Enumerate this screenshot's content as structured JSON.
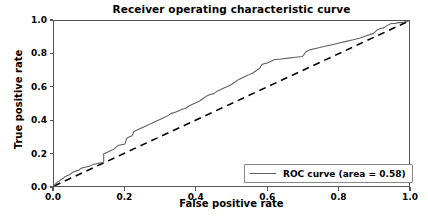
{
  "chart_data": {
    "type": "line",
    "title": "Receiver operating characteristic curve",
    "xlabel": "False positive rate",
    "ylabel": "True positive rate",
    "xlim": [
      0.0,
      1.0
    ],
    "ylim": [
      0.0,
      1.0
    ],
    "xticks": [
      "0.0",
      "0.2",
      "0.4",
      "0.6",
      "0.8",
      "1.0"
    ],
    "xtick_values": [
      0.0,
      0.2,
      0.4,
      0.6,
      0.8,
      1.0
    ],
    "yticks": [
      "0.0",
      "0.2",
      "0.4",
      "0.6",
      "0.8",
      "1.0"
    ],
    "ytick_values": [
      0.0,
      0.2,
      0.4,
      0.6,
      0.8,
      1.0
    ],
    "grid": false,
    "legend_position": "lower right",
    "series": [
      {
        "name": "ROC curve (area = 0.58)",
        "auc": 0.58,
        "color": "#606060",
        "linestyle": "solid",
        "x": [
          0.0,
          0.005,
          0.01,
          0.015,
          0.02,
          0.025,
          0.03,
          0.035,
          0.04,
          0.045,
          0.05,
          0.06,
          0.07,
          0.075,
          0.08,
          0.09,
          0.1,
          0.105,
          0.11,
          0.12,
          0.13,
          0.135,
          0.14,
          0.14,
          0.145,
          0.15,
          0.16,
          0.17,
          0.175,
          0.18,
          0.19,
          0.2,
          0.205,
          0.21,
          0.22,
          0.225,
          0.23,
          0.24,
          0.25,
          0.26,
          0.27,
          0.28,
          0.29,
          0.3,
          0.31,
          0.32,
          0.33,
          0.34,
          0.35,
          0.36,
          0.37,
          0.38,
          0.39,
          0.4,
          0.41,
          0.42,
          0.43,
          0.44,
          0.45,
          0.46,
          0.47,
          0.48,
          0.49,
          0.5,
          0.51,
          0.52,
          0.53,
          0.54,
          0.55,
          0.56,
          0.57,
          0.58,
          0.585,
          0.59,
          0.6,
          0.61,
          0.62,
          0.64,
          0.66,
          0.68,
          0.7,
          0.705,
          0.71,
          0.715,
          0.72,
          0.74,
          0.76,
          0.78,
          0.8,
          0.82,
          0.84,
          0.86,
          0.88,
          0.9,
          0.91,
          0.92,
          0.93,
          0.94,
          0.95,
          0.96,
          0.97,
          0.98,
          0.99,
          1.0
        ],
        "y": [
          0.0,
          0.015,
          0.025,
          0.03,
          0.04,
          0.045,
          0.055,
          0.06,
          0.065,
          0.07,
          0.08,
          0.09,
          0.095,
          0.105,
          0.11,
          0.115,
          0.12,
          0.125,
          0.13,
          0.135,
          0.14,
          0.14,
          0.145,
          0.195,
          0.2,
          0.205,
          0.215,
          0.225,
          0.235,
          0.245,
          0.25,
          0.255,
          0.29,
          0.295,
          0.305,
          0.33,
          0.335,
          0.345,
          0.355,
          0.365,
          0.375,
          0.385,
          0.395,
          0.405,
          0.415,
          0.425,
          0.44,
          0.445,
          0.455,
          0.465,
          0.47,
          0.485,
          0.495,
          0.505,
          0.515,
          0.53,
          0.545,
          0.555,
          0.56,
          0.575,
          0.585,
          0.595,
          0.605,
          0.615,
          0.63,
          0.645,
          0.655,
          0.665,
          0.675,
          0.685,
          0.7,
          0.715,
          0.735,
          0.74,
          0.745,
          0.755,
          0.765,
          0.77,
          0.775,
          0.78,
          0.785,
          0.8,
          0.815,
          0.82,
          0.825,
          0.835,
          0.845,
          0.855,
          0.865,
          0.875,
          0.885,
          0.895,
          0.91,
          0.925,
          0.945,
          0.955,
          0.96,
          0.975,
          0.985,
          0.985,
          0.99,
          0.99,
          0.995,
          1.0
        ]
      },
      {
        "name": "chance-diagonal",
        "color": "#000000",
        "linestyle": "dashed",
        "x": [
          0.0,
          1.0
        ],
        "y": [
          0.0,
          1.0
        ]
      }
    ]
  },
  "legend": {
    "entry_label": "ROC curve (area = 0.58)"
  }
}
